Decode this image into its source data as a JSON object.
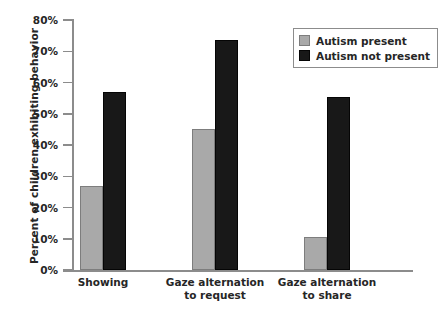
{
  "chart_data": {
    "type": "bar",
    "title": "",
    "xlabel": "",
    "ylabel": "Percent of children exhibiting behavior",
    "ylim": [
      0,
      80
    ],
    "ytick_labels": [
      "0%",
      "10%",
      "20%",
      "30%",
      "40%",
      "50%",
      "60%",
      "70%",
      "80%"
    ],
    "ytick_values": [
      0,
      10,
      20,
      30,
      40,
      50,
      60,
      70,
      80
    ],
    "grid": false,
    "legend_position": "top-right",
    "categories": [
      "Showing",
      "Gaze alternation to request",
      "Gaze alternation to share"
    ],
    "category_lines": [
      [
        "Showing"
      ],
      [
        "Gaze alternation",
        "to request"
      ],
      [
        "Gaze alternation",
        "to share"
      ]
    ],
    "series": [
      {
        "name": "Autism present",
        "color": "#a9a9a9",
        "values": [
          27,
          45,
          10.5
        ]
      },
      {
        "name": "Autism not present",
        "color": "#181818",
        "values": [
          57,
          73.5,
          55.5
        ]
      }
    ]
  },
  "axis": {
    "line_color": "#8c8c8c"
  }
}
